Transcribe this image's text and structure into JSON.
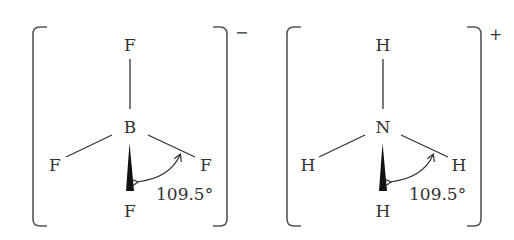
{
  "molecules": [
    {
      "name": "tetrafluoroborate",
      "central_atom": "B",
      "ligands": {
        "top": "F",
        "left": "F",
        "right": "F",
        "bottom": "F"
      },
      "charge": "−",
      "bond_angle": "109.5°"
    },
    {
      "name": "ammonium",
      "central_atom": "N",
      "ligands": {
        "top": "H",
        "left": "H",
        "right": "H",
        "bottom": "H"
      },
      "charge": "+",
      "bond_angle": "109.5°"
    }
  ],
  "colors": {
    "ink": "#333333",
    "bracket": "#555555",
    "background": "#ffffff"
  }
}
